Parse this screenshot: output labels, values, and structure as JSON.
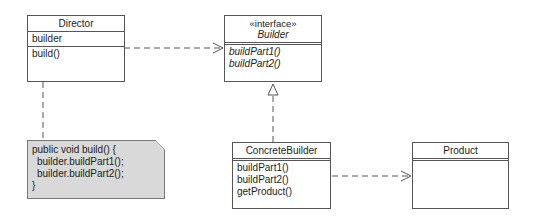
{
  "diagram": {
    "type": "UML class diagram (Builder pattern)",
    "classes": {
      "director": {
        "name": "Director",
        "attributes": [
          "builder"
        ],
        "operations": [
          "build()"
        ]
      },
      "builder": {
        "stereotype": "«interface»",
        "name": "Builder",
        "attributes": [],
        "operations": [
          "buildPart1()",
          "buildPart2()"
        ]
      },
      "concrete_builder": {
        "name": "ConcreteBuilder",
        "attributes": [],
        "operations": [
          "buildPart1()",
          "buildPart2()",
          "getProduct()"
        ]
      },
      "product": {
        "name": "Product",
        "attributes": [],
        "operations": []
      }
    },
    "note": {
      "lines": [
        "public void build() {",
        "builder.buildPart1();",
        "builder.buildPart2();",
        "}"
      ]
    },
    "relationships": [
      {
        "from": "Director",
        "to": "Builder",
        "kind": "dependency"
      },
      {
        "from": "ConcreteBuilder",
        "to": "Builder",
        "kind": "realization"
      },
      {
        "from": "ConcreteBuilder",
        "to": "Product",
        "kind": "dependency"
      },
      {
        "from": "Director",
        "to": "note",
        "kind": "note-anchor"
      }
    ],
    "colors": {
      "line": "#555555",
      "note_fill": "#d9d9d9",
      "box_fill": "#ffffff"
    }
  }
}
